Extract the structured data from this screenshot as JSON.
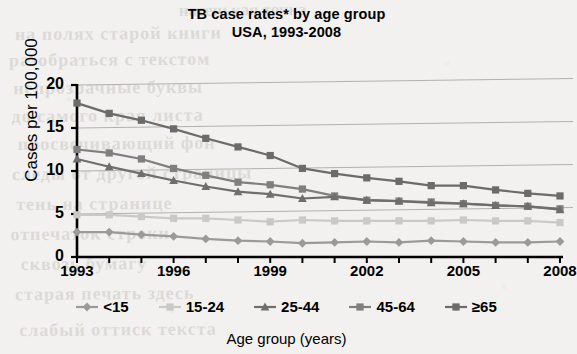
{
  "chart_data": {
    "type": "line",
    "title": "TB case rates* by age group",
    "subtitle": "USA, 1993-2008",
    "xlabel": "Age group (years)",
    "ylabel": "Cases per 100,000",
    "xlim": [
      1993,
      2008
    ],
    "ylim": [
      0,
      20
    ],
    "yticks": [
      "0",
      "5",
      "10",
      "15",
      "20"
    ],
    "ytick_values": [
      0,
      5,
      10,
      15,
      20
    ],
    "xticks": [
      "1993",
      "1996",
      "1999",
      "2002",
      "2005",
      "2008"
    ],
    "xtick_values": [
      1993,
      1996,
      1999,
      2002,
      2005,
      2008
    ],
    "x": [
      1993,
      1994,
      1995,
      1996,
      1997,
      1998,
      1999,
      2000,
      2001,
      2002,
      2003,
      2004,
      2005,
      2006,
      2007,
      2008
    ],
    "grid": "horizontal",
    "legend_position": "bottom",
    "series": [
      {
        "name": "<15",
        "marker": "diamond",
        "color": "#9a9a9a",
        "values": [
          2.9,
          2.9,
          2.6,
          2.4,
          2.1,
          1.9,
          1.8,
          1.6,
          1.7,
          1.8,
          1.7,
          1.9,
          1.8,
          1.7,
          1.7,
          1.8
        ]
      },
      {
        "name": "15-24",
        "marker": "square",
        "color": "#c9c9c9",
        "values": [
          4.9,
          4.9,
          4.7,
          4.5,
          4.5,
          4.3,
          4.1,
          4.3,
          4.2,
          4.2,
          4.2,
          4.2,
          4.3,
          4.2,
          4.2,
          4.0
        ]
      },
      {
        "name": "25-44",
        "marker": "triangle",
        "color": "#6e6e6e",
        "values": [
          11.4,
          10.5,
          9.7,
          8.9,
          8.2,
          7.6,
          7.3,
          6.8,
          7.0,
          6.6,
          6.5,
          6.3,
          6.2,
          6.0,
          5.9,
          5.5
        ]
      },
      {
        "name": "45-64",
        "marker": "square",
        "color": "#7f7f7f",
        "values": [
          12.5,
          12.1,
          11.4,
          10.3,
          9.5,
          8.7,
          8.4,
          7.9,
          7.1,
          6.6,
          6.5,
          6.4,
          6.2,
          6.0,
          5.9,
          5.6
        ]
      },
      {
        "name": "≥65",
        "marker": "square",
        "color": "#6b6b6b",
        "values": [
          17.9,
          16.7,
          15.9,
          14.9,
          13.8,
          12.8,
          11.8,
          10.3,
          9.7,
          9.2,
          8.8,
          8.3,
          8.3,
          7.8,
          7.4,
          7.1
        ]
      }
    ]
  },
  "ghost_text": {
    "lines": [
      "натенькая точка",
      "на полях старой книги",
      "разобраться с текстом",
      "непрозрачные буквы",
      "до самого края листа",
      "просвечивающий фон",
      "следы от другой страницы",
      "тень на странице",
      "отпечаток строки",
      "сквозь бумагу",
      "старая печать здесь",
      "слабый оттиск текста"
    ]
  }
}
